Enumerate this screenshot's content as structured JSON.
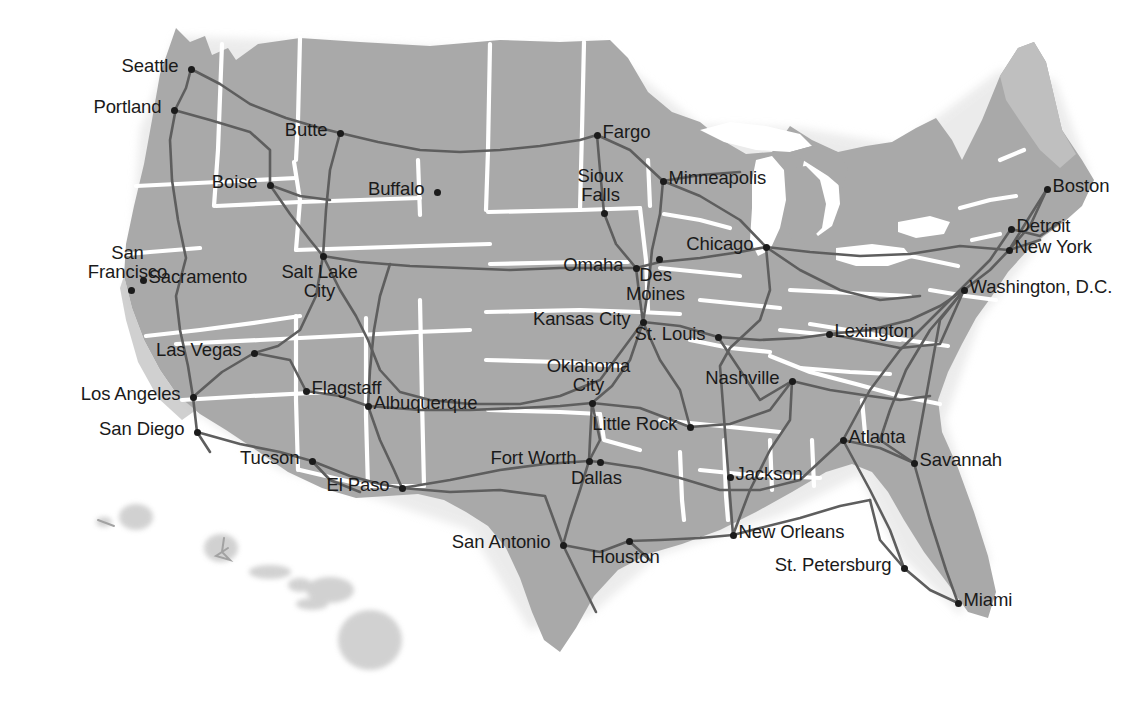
{
  "map": {
    "title": "United States Interstate Highway Map",
    "region": "Continental United States with Hawaii inset",
    "style": "grayscale reference map",
    "colors": {
      "background": "#ffffff",
      "land": "#a9a9a9",
      "land_light": "#c2c2c2",
      "state_border": "#ffffff",
      "highway": "#5e5e5e",
      "water": "#ffffff",
      "label_text": "#1a1a1a",
      "city_dot": "#1b1b1b"
    },
    "cities": [
      {
        "name": "Seattle",
        "x": 191,
        "y": 69,
        "pos": "l"
      },
      {
        "name": "Portland",
        "x": 174,
        "y": 110,
        "pos": "l"
      },
      {
        "name": "Butte",
        "x": 340,
        "y": 133,
        "pos": "l"
      },
      {
        "name": "Boise",
        "x": 270,
        "y": 185,
        "pos": "l"
      },
      {
        "name": "Buffalo",
        "x": 437,
        "y": 192,
        "pos": "l"
      },
      {
        "name": "Fargo",
        "x": 597,
        "y": 135,
        "pos": "r"
      },
      {
        "name": "Minneapolis",
        "x": 663,
        "y": 181,
        "pos": "r"
      },
      {
        "name": "Sioux Falls",
        "x": 604,
        "y": 213,
        "pos": "ct"
      },
      {
        "name": "Chicago",
        "x": 766,
        "y": 247,
        "pos": "l"
      },
      {
        "name": "Detroit",
        "x": 1011,
        "y": 229,
        "pos": "r"
      },
      {
        "name": "Boston",
        "x": 1047,
        "y": 189,
        "pos": "r"
      },
      {
        "name": "New York",
        "x": 1009,
        "y": 250,
        "pos": "r"
      },
      {
        "name": "Washington, D.C.",
        "x": 964,
        "y": 290,
        "pos": "r"
      },
      {
        "name": "Omaha",
        "x": 636,
        "y": 268,
        "pos": "l"
      },
      {
        "name": "Des Moines",
        "x": 659,
        "y": 259,
        "pos": "bc"
      },
      {
        "name": "Sacramento",
        "x": 143,
        "y": 280,
        "pos": "r"
      },
      {
        "name": "San Francisco",
        "x": 131,
        "y": 290,
        "pos": "ct"
      },
      {
        "name": "Salt Lake City",
        "x": 323,
        "y": 256,
        "pos": "bc"
      },
      {
        "name": "Kansas City",
        "x": 643,
        "y": 322,
        "pos": "l"
      },
      {
        "name": "St. Louis",
        "x": 718,
        "y": 337,
        "pos": "l"
      },
      {
        "name": "Lexington",
        "x": 829,
        "y": 334,
        "pos": "r"
      },
      {
        "name": "Las Vegas",
        "x": 254,
        "y": 353,
        "pos": "l"
      },
      {
        "name": "Flagstaff",
        "x": 306,
        "y": 391,
        "pos": "r"
      },
      {
        "name": "Los Angeles",
        "x": 193,
        "y": 397,
        "pos": "l"
      },
      {
        "name": "San Diego",
        "x": 197,
        "y": 432,
        "pos": "l"
      },
      {
        "name": "Albuquerque",
        "x": 368,
        "y": 406,
        "pos": "r"
      },
      {
        "name": "Oklahoma City",
        "x": 592,
        "y": 403,
        "pos": "ct"
      },
      {
        "name": "Nashville",
        "x": 792,
        "y": 381,
        "pos": "l"
      },
      {
        "name": "Little Rock",
        "x": 690,
        "y": 427,
        "pos": "l"
      },
      {
        "name": "Tucson",
        "x": 312,
        "y": 461,
        "pos": "l"
      },
      {
        "name": "El Paso",
        "x": 402,
        "y": 488,
        "pos": "l"
      },
      {
        "name": "Fort Worth",
        "x": 589,
        "y": 461,
        "pos": "l"
      },
      {
        "name": "Dallas",
        "x": 600,
        "y": 462,
        "pos": "bc"
      },
      {
        "name": "Jackson",
        "x": 730,
        "y": 477,
        "pos": "r"
      },
      {
        "name": "Atlanta",
        "x": 843,
        "y": 440,
        "pos": "r"
      },
      {
        "name": "Savannah",
        "x": 914,
        "y": 463,
        "pos": "r"
      },
      {
        "name": "San Antonio",
        "x": 563,
        "y": 545,
        "pos": "l"
      },
      {
        "name": "Houston",
        "x": 629,
        "y": 541,
        "pos": "bc"
      },
      {
        "name": "New Orleans",
        "x": 733,
        "y": 535,
        "pos": "r"
      },
      {
        "name": "St. Petersburg",
        "x": 904,
        "y": 568,
        "pos": "l"
      },
      {
        "name": "Miami",
        "x": 958,
        "y": 603,
        "pos": "r"
      }
    ]
  }
}
